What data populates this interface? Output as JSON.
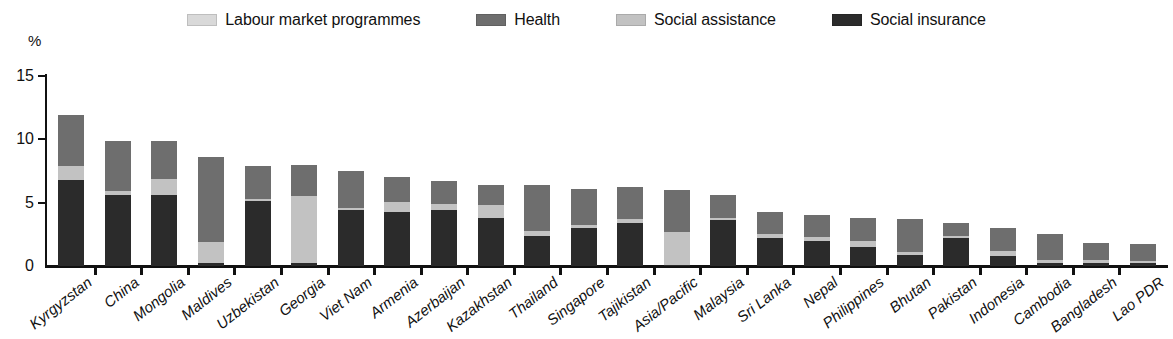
{
  "chart_data": {
    "type": "bar",
    "subtype": "stacked-bar",
    "title": "",
    "xlabel": "",
    "ylabel": "%",
    "ylim": [
      0,
      15
    ],
    "yticks": [
      0,
      5,
      10,
      15
    ],
    "ytick_labels": [
      "0",
      "5",
      "10",
      "15"
    ],
    "grid": false,
    "legend_position": "top",
    "stack_order_bottom_to_top": [
      "Social insurance",
      "Social assistance",
      "Health",
      "Labour market programmes"
    ],
    "categories": [
      "Kyrgyzstan",
      "China",
      "Mongolia",
      "Maldives",
      "Uzbekistan",
      "Georgia",
      "Viet Nam",
      "Armenia",
      "Azerbaijan",
      "Kazakhstan",
      "Thailand",
      "Singapore",
      "Tajikistan",
      "Asia/Pacific",
      "Malaysia",
      "Sri Lanka",
      "Nepal",
      "Philippines",
      "Bhutan",
      "Pakistan",
      "Indonesia",
      "Cambodia",
      "Bangladesh",
      "Lao PDR"
    ],
    "series": [
      {
        "name": "Social insurance",
        "color": "#2b2b2b",
        "values": [
          6.8,
          5.6,
          5.6,
          0.2,
          5.1,
          0.2,
          4.4,
          4.3,
          4.4,
          3.8,
          2.4,
          3.0,
          3.4,
          0.1,
          3.6,
          2.2,
          2.0,
          1.5,
          0.85,
          2.2,
          0.8,
          0.2,
          0.25,
          0.2
        ]
      },
      {
        "name": "Social assistance",
        "color": "#c2c2c2",
        "values": [
          1.1,
          0.35,
          1.3,
          1.7,
          0.2,
          5.3,
          0.2,
          0.75,
          0.5,
          1.0,
          0.35,
          0.2,
          0.3,
          2.6,
          0.2,
          0.35,
          0.3,
          0.5,
          0.25,
          0.2,
          0.4,
          0.3,
          0.25,
          0.2
        ]
      },
      {
        "name": "Health",
        "color": "#6e6e6e",
        "values": [
          4.0,
          3.9,
          3.0,
          6.7,
          2.6,
          2.5,
          2.9,
          1.95,
          1.8,
          1.6,
          3.65,
          2.9,
          2.5,
          3.3,
          1.8,
          1.75,
          1.7,
          1.8,
          2.6,
          1.0,
          1.8,
          2.0,
          1.3,
          1.3
        ]
      },
      {
        "name": "Labour market programmes",
        "color": "#d9d9d9",
        "values": [
          0.0,
          0.05,
          0.0,
          0.0,
          0.0,
          0.0,
          0.0,
          0.0,
          0.0,
          0.0,
          0.0,
          0.0,
          0.0,
          0.0,
          0.0,
          0.0,
          0.0,
          0.0,
          0.0,
          0.0,
          0.0,
          0.0,
          0.0,
          0.0
        ]
      }
    ],
    "totals": [
      11.9,
      9.9,
      9.9,
      8.6,
      7.9,
      8.0,
      7.5,
      7.0,
      6.7,
      6.4,
      6.4,
      6.1,
      6.2,
      6.0,
      5.6,
      4.3,
      4.0,
      3.8,
      3.7,
      3.4,
      3.0,
      2.5,
      1.8,
      1.7
    ]
  },
  "legend": {
    "items": [
      {
        "label": "Labour market programmes",
        "color": "#d9d9d9"
      },
      {
        "label": "Health",
        "color": "#6e6e6e"
      },
      {
        "label": "Social assistance",
        "color": "#c2c2c2"
      },
      {
        "label": "Social insurance",
        "color": "#2b2b2b"
      }
    ]
  },
  "axis": {
    "y_title": "%"
  }
}
